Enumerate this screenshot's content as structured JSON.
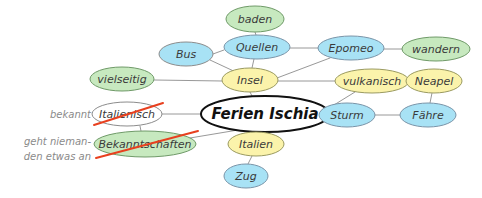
{
  "diagram": {
    "title": "Ferien Ischia",
    "type": "mind-map",
    "background": "#ffffff",
    "edge_color": "#8c8c8c",
    "strike_color": "#e8401f",
    "annotation_color": "#8a8a8a",
    "palette": {
      "cyan": "#a8e2f5",
      "yellow": "#fbf3ab",
      "green": "#c7e9bf",
      "white": "#ffffff",
      "outline_cyan": "#7a94a8",
      "outline_yellow": "#9a9a60",
      "outline_green": "#6f9a68",
      "outline_gray": "#8c8c8c",
      "outline_black": "#111111"
    }
  },
  "nodes": [
    {
      "id": "baden",
      "label": "baden",
      "cx": 255,
      "cy": 19,
      "rx": 29,
      "ry": 13,
      "fill": "#c7e9bf",
      "stroke": "#6f9a68",
      "stroke_width": 1,
      "font_size": 11,
      "text_fill": "#4a6a44",
      "struck": false
    },
    {
      "id": "bus",
      "label": "Bus",
      "cx": 186,
      "cy": 54,
      "rx": 27,
      "ry": 12,
      "fill": "#a8e2f5",
      "stroke": "#8c8c8c",
      "stroke_width": 1,
      "font_size": 11,
      "text_fill": "#3d5f75",
      "struck": false
    },
    {
      "id": "quellen",
      "label": "Quellen",
      "cx": 257,
      "cy": 47,
      "rx": 33,
      "ry": 12,
      "fill": "#a8e2f5",
      "stroke": "#7a94a8",
      "stroke_width": 1,
      "font_size": 11,
      "text_fill": "#3d5f75",
      "struck": false
    },
    {
      "id": "epomeo",
      "label": "Epomeo",
      "cx": 351,
      "cy": 48,
      "rx": 33,
      "ry": 12,
      "fill": "#a8e2f5",
      "stroke": "#7a94a8",
      "stroke_width": 1,
      "font_size": 11,
      "text_fill": "#3d5f75",
      "struck": false
    },
    {
      "id": "wandern",
      "label": "wandern",
      "cx": 436,
      "cy": 49,
      "rx": 34,
      "ry": 12,
      "fill": "#c7e9bf",
      "stroke": "#6f9a68",
      "stroke_width": 1,
      "font_size": 11,
      "text_fill": "#4a6a44",
      "struck": false
    },
    {
      "id": "vielseitig",
      "label": "vielseitig",
      "cx": 122,
      "cy": 79,
      "rx": 32,
      "ry": 12,
      "fill": "#c7e9bf",
      "stroke": "#6f9a68",
      "stroke_width": 1,
      "font_size": 11,
      "text_fill": "#4a6a44",
      "struck": false
    },
    {
      "id": "insel",
      "label": "Insel",
      "cx": 250,
      "cy": 80,
      "rx": 28,
      "ry": 12,
      "fill": "#fbf3ab",
      "stroke": "#9a9a60",
      "stroke_width": 1,
      "font_size": 11,
      "text_fill": "#7a6a2a",
      "struck": false
    },
    {
      "id": "vulkanisch",
      "label": "vulkanisch",
      "cx": 372,
      "cy": 81,
      "rx": 37,
      "ry": 12,
      "fill": "#fbf3ab",
      "stroke": "#9a9a60",
      "stroke_width": 1,
      "font_size": 11,
      "text_fill": "#7a6a2a",
      "struck": false
    },
    {
      "id": "neapel",
      "label": "Neapel",
      "cx": 434,
      "cy": 81,
      "rx": 28,
      "ry": 12,
      "fill": "#fbf3ab",
      "stroke": "#9a9a60",
      "stroke_width": 1,
      "font_size": 11,
      "text_fill": "#7a6a2a",
      "struck": false
    },
    {
      "id": "italienisch",
      "label": "Italienisch",
      "cx": 127,
      "cy": 114,
      "rx": 35,
      "ry": 12,
      "fill": "#ffffff",
      "stroke": "#8c8c8c",
      "stroke_width": 1,
      "font_size": 11,
      "text_fill": "#8a8a8a",
      "struck": true
    },
    {
      "id": "ferien-ischia",
      "label": "Ferien Ischia",
      "cx": 265,
      "cy": 114,
      "rx": 64,
      "ry": 18,
      "fill": "#ffffff",
      "stroke": "#111111",
      "stroke_width": 2,
      "font_size": 15,
      "text_fill": "#111111",
      "struck": false
    },
    {
      "id": "sturm",
      "label": "Sturm",
      "cx": 347,
      "cy": 115,
      "rx": 28,
      "ry": 12,
      "fill": "#a8e2f5",
      "stroke": "#7a94a8",
      "stroke_width": 1,
      "font_size": 11,
      "text_fill": "#3d5f75",
      "struck": false
    },
    {
      "id": "faehre",
      "label": "Fähre",
      "cx": 428,
      "cy": 115,
      "rx": 28,
      "ry": 12,
      "fill": "#a8e2f5",
      "stroke": "#7a94a8",
      "stroke_width": 1,
      "font_size": 11,
      "text_fill": "#3d5f75",
      "struck": false
    },
    {
      "id": "bekanntschaften",
      "label": "Bekanntschaften",
      "cx": 145,
      "cy": 144,
      "rx": 51,
      "ry": 13,
      "fill": "#c7e9bf",
      "stroke": "#6f9a68",
      "stroke_width": 1,
      "font_size": 11,
      "text_fill": "#4a6a44",
      "struck": true
    },
    {
      "id": "italien",
      "label": "Italien",
      "cx": 256,
      "cy": 144,
      "rx": 28,
      "ry": 12,
      "fill": "#fbf3ab",
      "stroke": "#9a9a60",
      "stroke_width": 1,
      "font_size": 11,
      "text_fill": "#7a6a2a",
      "struck": false
    },
    {
      "id": "zug",
      "label": "Zug",
      "cx": 246,
      "cy": 176,
      "rx": 22,
      "ry": 12,
      "fill": "#a8e2f5",
      "stroke": "#7a94a8",
      "stroke_width": 1,
      "font_size": 11,
      "text_fill": "#3d5f75",
      "struck": false
    }
  ],
  "edges": [
    {
      "from": "quellen",
      "to": "baden",
      "x1": 256,
      "y1": 35,
      "x2": 255,
      "y2": 32
    },
    {
      "from": "bus",
      "to": "quellen",
      "x1": 213,
      "y1": 54,
      "x2": 224,
      "y2": 50
    },
    {
      "from": "quellen",
      "to": "epomeo",
      "x1": 290,
      "y1": 48,
      "x2": 318,
      "y2": 48
    },
    {
      "from": "epomeo",
      "to": "wandern",
      "x1": 384,
      "y1": 49,
      "x2": 402,
      "y2": 49
    },
    {
      "from": "quellen",
      "to": "insel",
      "x1": 254,
      "y1": 59,
      "x2": 252,
      "y2": 68
    },
    {
      "from": "bus",
      "to": "insel",
      "x1": 210,
      "y1": 60,
      "x2": 240,
      "y2": 74
    },
    {
      "from": "epomeo",
      "to": "insel",
      "x1": 330,
      "y1": 58,
      "x2": 277,
      "y2": 78
    },
    {
      "from": "vielseitig",
      "to": "insel",
      "x1": 154,
      "y1": 80,
      "x2": 222,
      "y2": 81
    },
    {
      "from": "insel",
      "to": "vulkanisch",
      "x1": 278,
      "y1": 81,
      "x2": 335,
      "y2": 81
    },
    {
      "from": "vulkanisch",
      "to": "neapel",
      "x1": 409,
      "y1": 81,
      "x2": 406,
      "y2": 81
    },
    {
      "from": "insel",
      "to": "ferien-ischia",
      "x1": 250,
      "y1": 92,
      "x2": 252,
      "y2": 96
    },
    {
      "from": "vulkanisch",
      "to": "ferien-ischia",
      "x1": 355,
      "y1": 92,
      "x2": 300,
      "y2": 126
    },
    {
      "from": "neapel",
      "to": "faehre",
      "x1": 432,
      "y1": 93,
      "x2": 430,
      "y2": 103
    },
    {
      "from": "italienisch",
      "to": "ferien-ischia",
      "x1": 162,
      "y1": 114,
      "x2": 201,
      "y2": 114
    },
    {
      "from": "ferien-ischia",
      "to": "sturm",
      "x1": 329,
      "y1": 115,
      "x2": 319,
      "y2": 115
    },
    {
      "from": "sturm",
      "to": "faehre",
      "x1": 375,
      "y1": 115,
      "x2": 400,
      "y2": 115
    },
    {
      "from": "italienisch",
      "to": "bekanntschaften",
      "x1": 140,
      "y1": 126,
      "x2": 141,
      "y2": 131
    },
    {
      "from": "bekanntschaften",
      "to": "ferien-ischia",
      "x1": 190,
      "y1": 138,
      "x2": 238,
      "y2": 130
    },
    {
      "from": "ferien-ischia",
      "to": "italien",
      "x1": 258,
      "y1": 132,
      "x2": 257,
      "y2": 132
    },
    {
      "from": "italien",
      "to": "zug",
      "x1": 252,
      "y1": 156,
      "x2": 248,
      "y2": 164
    }
  ],
  "strikes": [
    {
      "node": "italienisch",
      "x1": 94,
      "y1": 125,
      "x2": 163,
      "y2": 103
    },
    {
      "node": "bekanntschaften",
      "x1": 96,
      "y1": 158,
      "x2": 198,
      "y2": 131
    }
  ],
  "annotations": [
    {
      "id": "annotation-bekannt",
      "lines": [
        "bekannt"
      ],
      "x": 91,
      "y": 118,
      "anchor": "end",
      "font_size": 10
    },
    {
      "id": "annotation-geht-niemanden-etwas-an",
      "lines": [
        "geht nieman-",
        "den etwas an"
      ],
      "x": 91,
      "y": 145,
      "anchor": "end",
      "font_size": 10
    }
  ]
}
